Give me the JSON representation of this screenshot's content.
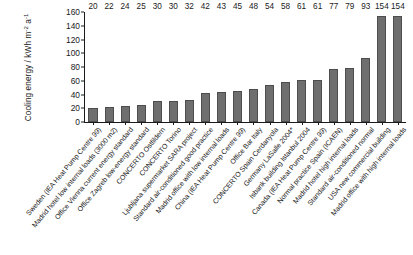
{
  "chart_data": {
    "type": "bar",
    "title": "",
    "xlabel": "",
    "ylabel": "Cooling energy / kWh m-2 a-1",
    "ylabel_parts": {
      "main": "Cooling energy / kWh m",
      "sup1": "-2",
      "mid": " a",
      "sup2": "-1"
    },
    "ylim": [
      0,
      160
    ],
    "yticks": [
      160,
      140,
      120,
      100,
      80,
      60,
      40,
      20,
      0
    ],
    "grid": false,
    "legend": "none",
    "categories": [
      "Sweden (IEA Heat Pump Centre 99)",
      "Madrid hotel low internal loads (3000 m2)",
      "Office Vienna current energy standard",
      "Office Zagreb low-energy standard",
      "CONCERTO Ostfildern",
      "CONCERTO Torino",
      "Ljubljana supermarket SARA project",
      "Standard air-conditioned good practice",
      "Madrid office with low internal loads",
      "China (IEA Heat Pump Centre 99)",
      "Office Bar Italy",
      "CONCERTO Spain Cerdanyola",
      "Germany LaSalle 2004*",
      "Isbank building Istanbul 2004",
      "Canada (IEA Heat Pump Centre 99)",
      "Normal practice Spain (ICAEN)",
      "Madrid hotel high internal loads",
      "Standard air-conditioned normal",
      "USA new commercial building",
      "Madrid office with high internal loads"
    ],
    "values": [
      20,
      22,
      24,
      25,
      30,
      30,
      32,
      42,
      43,
      45,
      48,
      54,
      58,
      61,
      61,
      77,
      79,
      93,
      154,
      154
    ],
    "colors": {
      "bar_fill": "#6e6e6e",
      "bar_stroke": "#4d4d4d",
      "axis": "#1a1a1a",
      "background": "#ffffff"
    }
  }
}
